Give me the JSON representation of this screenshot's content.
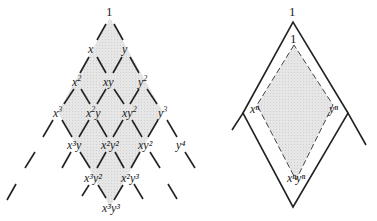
{
  "left_diagram": {
    "top": "1",
    "row1": [
      "x",
      "y"
    ],
    "row2": [
      "x",
      "xy",
      "y"
    ],
    "row2_sup": [
      "2",
      "",
      "2"
    ],
    "row3_base": [
      "x",
      "x",
      "xy",
      "y"
    ],
    "row3_sup": [
      "3",
      "2",
      "2",
      "3"
    ],
    "row4_labels": [
      "x³y",
      "x²y²",
      "xy²",
      "y⁴"
    ],
    "row5_labels": [
      "x³y²",
      "x²y³"
    ],
    "bottom_label": "x³y³"
  },
  "right_diagram": {
    "outer_top": "1",
    "inner_top": "1",
    "left": "xⁿ",
    "right": "yⁿ",
    "bottom": "xⁿyⁿ"
  },
  "colors": {
    "shade": "#e4e4e4",
    "line": "#222222"
  }
}
